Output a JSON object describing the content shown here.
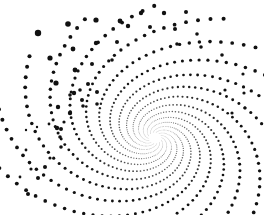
{
  "canvas": {
    "width": 264,
    "height": 215,
    "background": "#ffffff"
  },
  "dot_color": "#111111",
  "spiral": {
    "center": [
      155,
      138
    ],
    "arms": 14,
    "dots_per_arm": 70,
    "start_radius": 6,
    "growth": 0.045,
    "turn_span": 5.2,
    "max_dot_radius": 3.4,
    "min_dot_radius": 0.35
  },
  "scatter": {
    "points": [
      [
        38,
        33,
        3.2
      ],
      [
        68,
        24,
        2.8
      ],
      [
        96,
        20,
        2.6
      ],
      [
        120,
        21,
        2.4
      ],
      [
        73,
        49,
        2.4
      ],
      [
        96,
        43,
        2.2
      ],
      [
        117,
        42,
        2.0
      ],
      [
        128,
        26,
        2.2
      ],
      [
        50,
        58,
        2.6
      ],
      [
        75,
        70,
        2.4
      ],
      [
        92,
        64,
        2.0
      ],
      [
        112,
        60,
        1.8
      ],
      [
        56,
        83,
        2.6
      ],
      [
        74,
        93,
        2.2
      ],
      [
        88,
        84,
        2.0
      ],
      [
        97,
        92,
        2.0
      ],
      [
        58,
        107,
        2.2
      ],
      [
        70,
        113,
        2.2
      ],
      [
        82,
        100,
        2.0
      ],
      [
        97,
        104,
        1.8
      ],
      [
        57,
        128,
        2.2
      ],
      [
        61,
        129,
        2.0
      ],
      [
        60,
        137,
        1.8
      ],
      [
        61,
        147,
        1.8
      ],
      [
        50,
        158,
        1.6
      ],
      [
        45,
        167,
        2.0
      ],
      [
        38,
        178,
        2.0
      ],
      [
        28,
        194,
        2.0
      ],
      [
        31,
        169,
        1.6
      ],
      [
        26,
        150,
        1.4
      ],
      [
        20,
        177,
        1.4
      ],
      [
        26,
        130,
        1.2
      ],
      [
        37,
        127,
        1.2
      ],
      [
        49,
        124,
        1.4
      ],
      [
        64,
        122,
        1.6
      ],
      [
        83,
        106,
        1.8
      ],
      [
        70,
        95,
        1.8
      ],
      [
        80,
        90,
        1.8
      ],
      [
        141,
        13,
        2.2
      ],
      [
        164,
        13,
        2.2
      ],
      [
        186,
        12,
        2.0
      ],
      [
        150,
        27,
        2.0
      ],
      [
        175,
        29,
        2.0
      ],
      [
        197,
        34,
        1.8
      ],
      [
        177,
        44,
        1.8
      ],
      [
        201,
        47,
        1.8
      ],
      [
        222,
        55,
        1.8
      ],
      [
        243,
        74,
        1.6
      ],
      [
        244,
        93,
        1.6
      ],
      [
        225,
        90,
        1.6
      ],
      [
        245,
        108,
        1.6
      ],
      [
        232,
        113,
        1.6
      ]
    ]
  }
}
